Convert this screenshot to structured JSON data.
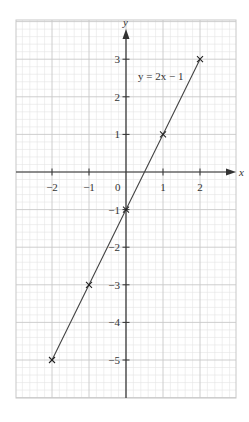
{
  "chart_data": {
    "type": "line",
    "title": "",
    "xlabel": "x",
    "ylabel": "y",
    "xlim": [
      -2.93,
      2.95
    ],
    "ylim": [
      -6.05,
      4.05
    ],
    "grid": true,
    "grid_minor_per_unit": 5,
    "x_ticks": [
      -2,
      -1,
      0,
      1,
      2
    ],
    "x_tick_labels": [
      "−2",
      "−1",
      "0",
      "1",
      "2"
    ],
    "y_ticks": [
      -5,
      -4,
      -3,
      -2,
      -1,
      1,
      2,
      3
    ],
    "y_tick_labels": [
      "−5",
      "−4",
      "−3",
      "−2",
      "−1",
      "1",
      "2",
      "3"
    ],
    "series": [
      {
        "name": "y = 2x − 1",
        "x": [
          -2,
          -1,
          0,
          1,
          2
        ],
        "y": [
          -5,
          -3,
          -1,
          1,
          3
        ],
        "marker": "x",
        "color": "#333333"
      }
    ],
    "annotations": [
      {
        "text": "y = 2x − 1",
        "x": 0.6,
        "y": 2.55
      }
    ]
  },
  "labels": {
    "x_axis": "x",
    "y_axis": "y",
    "origin": "0",
    "equation": "y = 2x − 1"
  },
  "colors": {
    "minor_grid": "#e4e4e4",
    "major_grid": "#c8c8c8",
    "axis": "#333333",
    "line": "#444444"
  }
}
